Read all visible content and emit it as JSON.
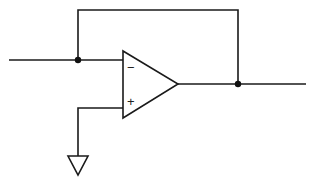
{
  "diagram": {
    "type": "op-amp schematic",
    "components": [
      {
        "id": "opamp",
        "kind": "operational-amplifier",
        "inputs": {
          "inverting": "-",
          "non_inverting": "+"
        }
      },
      {
        "id": "ground",
        "kind": "ground-symbol"
      },
      {
        "id": "junction-input",
        "kind": "junction-node"
      },
      {
        "id": "junction-output",
        "kind": "junction-node"
      }
    ],
    "connections": [
      {
        "from": "input-terminal",
        "to": "junction-input"
      },
      {
        "from": "junction-input",
        "to": "opamp.inverting"
      },
      {
        "from": "junction-input",
        "to": "junction-output",
        "via": "feedback-path"
      },
      {
        "from": "opamp.output",
        "to": "junction-output"
      },
      {
        "from": "junction-output",
        "to": "output-terminal"
      },
      {
        "from": "opamp.non_inverting",
        "to": "ground"
      }
    ],
    "labels": {
      "minus": "−",
      "plus": "+"
    },
    "colors": {
      "line": "#1a1a1a",
      "background": "#ffffff"
    }
  }
}
